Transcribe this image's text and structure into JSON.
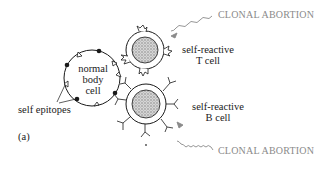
{
  "diagram": {
    "panel_label": "(a)",
    "body_cell": {
      "label_line1": "normal",
      "label_line2": "body",
      "label_line3": "cell"
    },
    "epitopes_label": "self epitopes",
    "t_cell": {
      "label_line1": "self-reactive",
      "label_line2": "T cell"
    },
    "b_cell": {
      "label_line1": "self-reactive",
      "label_line2": "B cell"
    },
    "arrow_top": {
      "label": "CLONAL ABORTION"
    },
    "arrow_bottom": {
      "label": "CLONAL ABORTION"
    },
    "colors": {
      "ink": "#1a1a1a",
      "gray_text": "#8a8a8a",
      "nucleus": "#b8b8b8",
      "background": "#ffffff"
    }
  }
}
